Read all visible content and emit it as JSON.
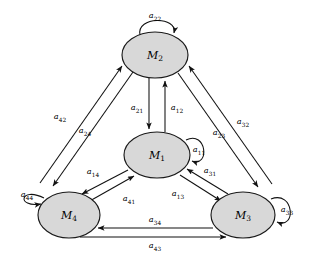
{
  "figure": {
    "background_color": "#ffffff",
    "node_fill_color": "#d8d8d8",
    "node_stroke_color": "#1a1a1a",
    "edge_color": "#111111"
  },
  "nodes": [
    {
      "id": "M1",
      "label": "M",
      "sub": "1",
      "cx": 157,
      "cy": 155,
      "rx": 33,
      "ry": 23
    },
    {
      "id": "M2",
      "label": "M",
      "sub": "2",
      "cx": 155,
      "cy": 55,
      "rx": 33,
      "ry": 23
    },
    {
      "id": "M3",
      "label": "M",
      "sub": "3",
      "cx": 243,
      "cy": 215,
      "rx": 32,
      "ry": 23
    },
    {
      "id": "M4",
      "label": "M",
      "sub": "4",
      "cx": 69,
      "cy": 215,
      "rx": 31,
      "ry": 23
    }
  ],
  "self_loops": [
    {
      "id": "a11",
      "label": "a",
      "sub": "11",
      "from": "M1",
      "to": "M1",
      "position": "right",
      "label_x": 200,
      "label_y": 147
    },
    {
      "id": "a22",
      "label": "a",
      "sub": "22",
      "from": "M2",
      "to": "M2",
      "position": "top",
      "label_x": 155,
      "label_y": 16
    },
    {
      "id": "a33",
      "label": "a",
      "sub": "33",
      "from": "M3",
      "to": "M3",
      "position": "right",
      "label_x": 288,
      "label_y": 208
    },
    {
      "id": "a44",
      "label": "a",
      "sub": "44",
      "from": "M4",
      "to": "M4",
      "position": "left",
      "label_x": 25,
      "label_y": 197
    }
  ],
  "edges": [
    {
      "id": "a21",
      "label": "a",
      "sub": "21",
      "from": "M2",
      "to": "M1",
      "label_x": 137,
      "label_y": 108
    },
    {
      "id": "a12",
      "label": "a",
      "sub": "12",
      "from": "M1",
      "to": "M2",
      "label_x": 177,
      "label_y": 108
    },
    {
      "id": "a42",
      "label": "a",
      "sub": "42",
      "from": "M4",
      "to": "M2",
      "label_x": 60,
      "label_y": 117
    },
    {
      "id": "a24",
      "label": "a",
      "sub": "24",
      "from": "M2",
      "to": "M4",
      "label_x": 85,
      "label_y": 131
    },
    {
      "id": "a32",
      "label": "a",
      "sub": "32",
      "from": "M3",
      "to": "M2",
      "label_x": 243,
      "label_y": 122
    },
    {
      "id": "a23",
      "label": "a",
      "sub": "23",
      "from": "M2",
      "to": "M3",
      "label_x": 219,
      "label_y": 133
    },
    {
      "id": "a14",
      "label": "a",
      "sub": "14",
      "from": "M1",
      "to": "M4",
      "label_x": 93,
      "label_y": 172
    },
    {
      "id": "a41",
      "label": "a",
      "sub": "41",
      "from": "M4",
      "to": "M1",
      "label_x": 129,
      "label_y": 199
    },
    {
      "id": "a31",
      "label": "a",
      "sub": "31",
      "from": "M3",
      "to": "M1",
      "label_x": 210,
      "label_y": 171
    },
    {
      "id": "a13",
      "label": "a",
      "sub": "13",
      "from": "M1",
      "to": "M3",
      "label_x": 178,
      "label_y": 194
    },
    {
      "id": "a34",
      "label": "a",
      "sub": "34",
      "from": "M3",
      "to": "M4",
      "label_x": 155,
      "label_y": 220
    },
    {
      "id": "a43",
      "label": "a",
      "sub": "43",
      "from": "M4",
      "to": "M3",
      "label_x": 155,
      "label_y": 246
    }
  ]
}
